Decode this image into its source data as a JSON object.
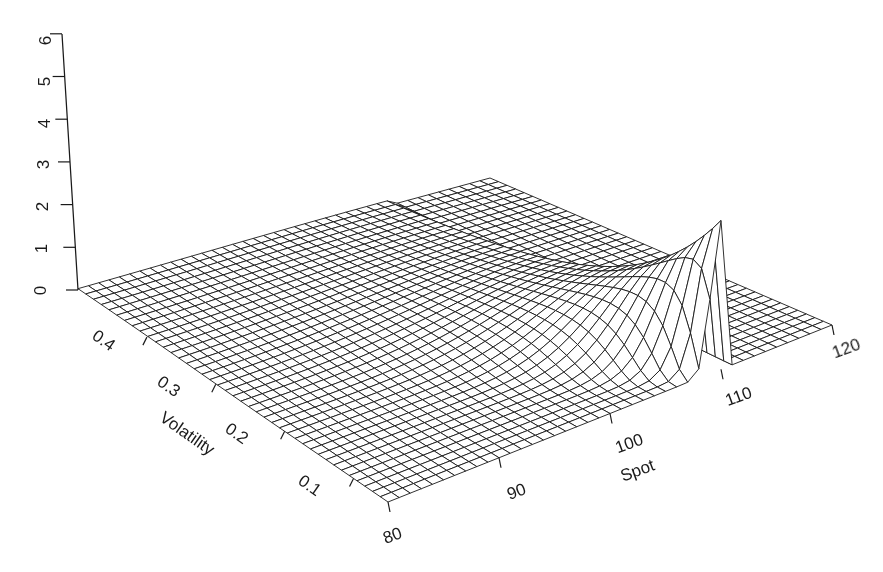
{
  "chart_data": {
    "type": "surface3d",
    "title": "",
    "x_axis": {
      "label": "Spot",
      "range": [
        80,
        120
      ],
      "ticks": [
        80,
        90,
        100,
        110,
        120
      ]
    },
    "y_axis": {
      "label": "Volatility",
      "range": [
        0.05,
        0.5
      ],
      "ticks": [
        0.1,
        0.2,
        0.3,
        0.4
      ]
    },
    "z_axis": {
      "label": "",
      "range": [
        0,
        6
      ],
      "ticks": [
        0,
        1,
        2,
        3,
        4,
        5,
        6
      ]
    },
    "grid": {
      "nx": 41,
      "ny": 41
    },
    "surface_description": "Flat near zero across most of the domain; sharp ridge rising near Spot≈110 at low volatility, peaking ≈3.5, decaying smoothly toward lower spot and higher volatility.",
    "peak": {
      "spot": 110,
      "volatility": 0.05,
      "value": 3.5
    },
    "style": {
      "line_color": "#1a1a1a",
      "face_color": "#ffffff",
      "background": "#ffffff"
    }
  },
  "labels": {
    "z_ticks": [
      "0",
      "1",
      "2",
      "3",
      "4",
      "5",
      "6"
    ],
    "vol_ticks": [
      "0.1",
      "0.2",
      "0.3",
      "0.4"
    ],
    "spot_ticks": [
      "80",
      "90",
      "100",
      "110",
      "120"
    ],
    "vol_title": "Volatility",
    "spot_title": "Spot"
  }
}
